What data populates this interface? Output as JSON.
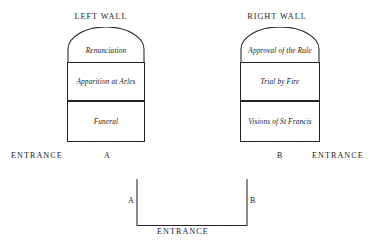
{
  "figure": {
    "type": "architectural-fresco-scheme",
    "ink_color": "#1b1b1f",
    "background_color": "#ffffff"
  },
  "walls": [
    {
      "id": "left-wall",
      "title": "LEFT WALL",
      "entrance_label": "ENTRANCE",
      "entrance_side": "left",
      "corner_marker": "A",
      "registers": [
        {
          "shape": "lunette",
          "label": "Renunciation"
        },
        {
          "shape": "rectangle",
          "label": "Apparition at Arles"
        },
        {
          "shape": "rectangle",
          "label": "Funeral"
        }
      ]
    },
    {
      "id": "right-wall",
      "title": "RIGHT WALL",
      "entrance_label": "ENTRANCE",
      "entrance_side": "right",
      "corner_marker": "B",
      "registers": [
        {
          "shape": "lunette",
          "label": "Approval of the Rule"
        },
        {
          "shape": "rectangle",
          "label": "Trial by Fire"
        },
        {
          "shape": "rectangle",
          "label": "Visions of St Francis"
        }
      ]
    }
  ],
  "plan": {
    "id": "floor-plan",
    "left_marker": "A",
    "right_marker": "B",
    "entrance_label": "ENTRANCE"
  }
}
